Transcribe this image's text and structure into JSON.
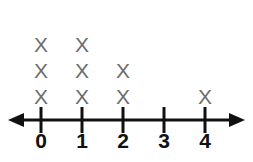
{
  "chart_data": {
    "type": "dot-plot",
    "title": "",
    "xlabel": "",
    "ylabel": "",
    "categories": [
      "0",
      "1",
      "2",
      "3",
      "4"
    ],
    "values": [
      3,
      3,
      2,
      0,
      1
    ],
    "mark_glyph": "X",
    "mark_color": "#6e6e6e",
    "axis_color": "#111111",
    "label_color": "#111111",
    "background": "#ffffff",
    "axis_has_arrows_both_ends": true,
    "grid": false,
    "legend": null,
    "xlim": [
      0,
      4
    ],
    "tick_positions_px": [
      41,
      82,
      123,
      164,
      205
    ],
    "axis_y_px": 120
  },
  "marks": {
    "columns": [
      {
        "label": "0",
        "count": 3,
        "x_px": 41,
        "glyphs": [
          "X",
          "X",
          "X"
        ]
      },
      {
        "label": "1",
        "count": 3,
        "x_px": 82,
        "glyphs": [
          "X",
          "X",
          "X"
        ]
      },
      {
        "label": "2",
        "count": 2,
        "x_px": 123,
        "glyphs": [
          "X",
          "X"
        ]
      },
      {
        "label": "3",
        "count": 0,
        "x_px": 164,
        "glyphs": []
      },
      {
        "label": "4",
        "count": 1,
        "x_px": 205,
        "glyphs": [
          "X"
        ]
      }
    ]
  },
  "axis": {
    "labels": [
      "0",
      "1",
      "2",
      "3",
      "4"
    ],
    "left_arrow": "left-arrow",
    "right_arrow": "right-arrow"
  }
}
